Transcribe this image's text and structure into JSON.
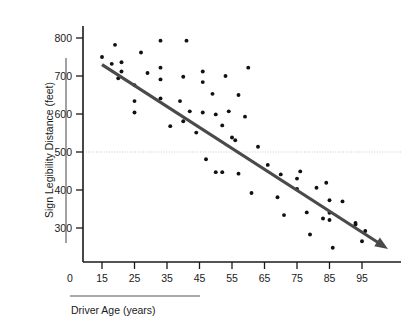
{
  "chart_data": {
    "type": "scatter",
    "title": "",
    "subtitle": "",
    "xlabel": "Driver Age (years)",
    "ylabel": "Sign Legibility Distance (feet)",
    "xlim": [
      10,
      103
    ],
    "ylim": [
      210,
      830
    ],
    "grid": false,
    "legend": null,
    "x_origin_label": "0",
    "y_origin_label": "0",
    "xticks": [
      15,
      25,
      35,
      45,
      55,
      65,
      75,
      85,
      95
    ],
    "xtick_labels": [
      "15",
      "25",
      "35",
      "45",
      "55",
      "65",
      "75",
      "85",
      "95"
    ],
    "yticks": [
      300,
      400,
      500,
      600,
      700,
      800
    ],
    "ytick_labels": [
      "300",
      "400",
      "500",
      "600",
      "700",
      "800"
    ],
    "reference_line": {
      "orientation": "horizontal",
      "value": 500,
      "style": "dotted",
      "color": "#c9c9c9"
    },
    "trend_line": {
      "label": "",
      "color": "#4a4a4a",
      "arrow_end": true,
      "x_start": 15,
      "y_start": 730,
      "x_end": 103,
      "y_end": 245
    },
    "series": [
      {
        "name": "Driver sign legibility observations",
        "marker": "circle",
        "color": "#111111",
        "points": [
          [
            15,
            750
          ],
          [
            19,
            782
          ],
          [
            18,
            732
          ],
          [
            20,
            694
          ],
          [
            21,
            736
          ],
          [
            21,
            712
          ],
          [
            25,
            676
          ],
          [
            25,
            634
          ],
          [
            25,
            604
          ],
          [
            27,
            762
          ],
          [
            29,
            708
          ],
          [
            33,
            722
          ],
          [
            33,
            793
          ],
          [
            33,
            691
          ],
          [
            33,
            641
          ],
          [
            36,
            568
          ],
          [
            39,
            634
          ],
          [
            40,
            698
          ],
          [
            41,
            793
          ],
          [
            40,
            581
          ],
          [
            42,
            607
          ],
          [
            44,
            551
          ],
          [
            46,
            712
          ],
          [
            46,
            684
          ],
          [
            46,
            604
          ],
          [
            47,
            481
          ],
          [
            49,
            653
          ],
          [
            50,
            599
          ],
          [
            50,
            447
          ],
          [
            52,
            570
          ],
          [
            52,
            447
          ],
          [
            53,
            700
          ],
          [
            54,
            607
          ],
          [
            55,
            538
          ],
          [
            56,
            531
          ],
          [
            57,
            650
          ],
          [
            57,
            443
          ],
          [
            59,
            593
          ],
          [
            60,
            722
          ],
          [
            61,
            392
          ],
          [
            63,
            514
          ],
          [
            66,
            466
          ],
          [
            69,
            381
          ],
          [
            70,
            441
          ],
          [
            71,
            334
          ],
          [
            75,
            430
          ],
          [
            75,
            403
          ],
          [
            76,
            449
          ],
          [
            78,
            341
          ],
          [
            79,
            283
          ],
          [
            81,
            406
          ],
          [
            83,
            325
          ],
          [
            84,
            419
          ],
          [
            85,
            373
          ],
          [
            85,
            321
          ],
          [
            85,
            340
          ],
          [
            86,
            248
          ],
          [
            89,
            370
          ],
          [
            93,
            313
          ],
          [
            93,
            309
          ],
          [
            95,
            265
          ],
          [
            96,
            292
          ]
        ]
      }
    ]
  }
}
